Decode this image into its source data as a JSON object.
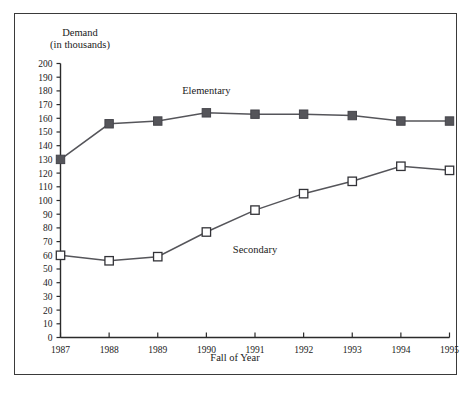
{
  "chart_data": {
    "type": "line",
    "title": "",
    "ylabel_line1": "Demand",
    "ylabel_line2": "(in thousands)",
    "xlabel": "Fall of Year",
    "categories": [
      "1987",
      "1988",
      "1989",
      "1990",
      "1991",
      "1992",
      "1993",
      "1994",
      "1995"
    ],
    "x": [
      1987,
      1988,
      1989,
      1990,
      1991,
      1992,
      1993,
      1994,
      1995
    ],
    "ylim": [
      0,
      200
    ],
    "ytick_step": 10,
    "yticks": [
      0,
      10,
      20,
      30,
      40,
      50,
      60,
      70,
      80,
      90,
      100,
      110,
      120,
      130,
      140,
      150,
      160,
      170,
      180,
      190,
      200
    ],
    "grid": false,
    "legend_position": "inline-annotations",
    "series": [
      {
        "name": "Elementary",
        "marker": "filled-square",
        "color": "#55555a",
        "label_x": 1990.0,
        "label_y": 178,
        "values": [
          130,
          156,
          158,
          164,
          163,
          163,
          162,
          158,
          158
        ]
      },
      {
        "name": "Secondary",
        "marker": "hollow-square",
        "color": "#333338",
        "label_x": 1991.0,
        "label_y": 62,
        "values": [
          60,
          56,
          59,
          77,
          93,
          105,
          114,
          125,
          122
        ]
      }
    ]
  },
  "colors": {
    "frame": "#3a3a3a",
    "axis": "#2b2b2b",
    "elementary": "#55555a",
    "secondary": "#333338",
    "background": "#ffffff"
  }
}
